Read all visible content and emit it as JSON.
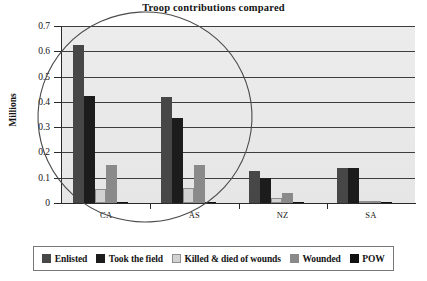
{
  "chart_data": {
    "type": "bar",
    "title": "Troop contributions compared",
    "xlabel": "",
    "ylabel": "Millions",
    "ylim": [
      0,
      0.7
    ],
    "ytick_labels": [
      "0.7",
      "0.6",
      "0.5",
      "0.4",
      "0.3",
      "0.2",
      "0.1",
      "0"
    ],
    "ytick_values": [
      0.7,
      0.6,
      0.5,
      0.4,
      0.3,
      0.2,
      0.1,
      0
    ],
    "grid": true,
    "legend_position": "bottom",
    "categories": [
      "CA",
      "AS",
      "NZ",
      "SA"
    ],
    "series": [
      {
        "name": "Enlisted",
        "color": "#474747",
        "values": [
          0.625,
          0.42,
          0.128,
          0.138
        ]
      },
      {
        "name": "Took the field",
        "color": "#1c1c1c",
        "values": [
          0.425,
          0.335,
          0.098,
          0.138
        ]
      },
      {
        "name": "Killed & died of wounds",
        "color": "#d2d2d2",
        "values": [
          0.057,
          0.06,
          0.018,
          0.004
        ]
      },
      {
        "name": "Wounded",
        "color": "#8a8a8a",
        "values": [
          0.15,
          0.152,
          0.04,
          0.009
        ]
      },
      {
        "name": "POW",
        "color": "#111111",
        "values": [
          0.005,
          0.005,
          0.002,
          0.002
        ]
      }
    ],
    "annotations": [
      {
        "type": "ellipse",
        "label": "hand-drawn circle around CA and AS groups"
      }
    ]
  },
  "legend": {
    "items": [
      {
        "label": "Enlisted",
        "color": "#474747"
      },
      {
        "label": "Took the field",
        "color": "#1c1c1c"
      },
      {
        "label": "Killed & died of wounds",
        "color": "#d2d2d2"
      },
      {
        "label": "Wounded",
        "color": "#8a8a8a"
      },
      {
        "label": "POW",
        "color": "#111111"
      }
    ]
  }
}
